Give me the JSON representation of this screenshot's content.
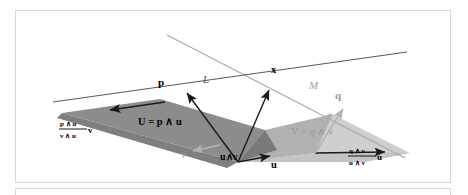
{
  "figure": {
    "name": "meet-and-join-of-lines-diagram",
    "colors": {
      "frame_border": "#d8d8d8",
      "background": "#ffffff",
      "line_dark": "#4a4a4a",
      "line_gray": "#a8a8a8",
      "plane_dark": "#8c8c8c",
      "plane_mid": "#a3a3a3",
      "plane_light": "#c4c4c4",
      "plane_lighter": "#cfcfcf",
      "arrow_dark": "#1a1a1a",
      "arrow_gray": "#b0b0b0",
      "text_dark": "#000000",
      "text_gray": "#9a9a9a"
    },
    "labels": {
      "line_L": "L",
      "line_M": "M",
      "point_x": "x",
      "vector_p": "p",
      "vector_q": "q",
      "vector_u": "u",
      "vector_v": "v",
      "apex_meet": "u∧v",
      "plane_U": "U = p ∧ u",
      "plane_V": "V = q ∧ v",
      "left_fraction": {
        "numerator": "p ∧ u",
        "denominator": "v ∧ u",
        "multiplier": "v"
      },
      "right_fraction": {
        "numerator": "q ∧ v",
        "denominator": "u ∧ v",
        "multiplier": "u"
      }
    }
  }
}
